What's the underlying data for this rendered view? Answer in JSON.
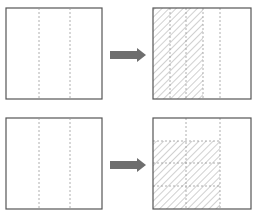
{
  "diagram": {
    "colors": {
      "outline": "#555555",
      "dashed": "#999999",
      "hatch": "#888888",
      "arrow": "#6e6e6e",
      "background": "#ffffff"
    },
    "rows": [
      {
        "name": "row-1",
        "left_square": {
          "x": 6,
          "y": 8,
          "w": 96,
          "h": 91,
          "vertical_dividers": [
            39,
            70
          ]
        },
        "arrow": {
          "x1": 110,
          "x2": 146,
          "y": 55
        },
        "right_square": {
          "x": 153,
          "y": 8,
          "w": 98,
          "h": 91,
          "vertical_dividers": [
            170,
            186,
            203,
            220
          ],
          "horizontal_dividers": [],
          "shaded": {
            "x": 153,
            "y": 8,
            "w": 50,
            "h": 91
          }
        }
      },
      {
        "name": "row-2",
        "left_square": {
          "x": 6,
          "y": 118,
          "w": 96,
          "h": 91,
          "vertical_dividers": [
            39,
            70
          ]
        },
        "arrow": {
          "x1": 110,
          "x2": 146,
          "y": 165
        },
        "right_square": {
          "x": 153,
          "y": 118,
          "w": 98,
          "h": 91,
          "vertical_dividers": [
            186,
            220
          ],
          "horizontal_dividers": [
            141,
            163,
            186
          ],
          "shaded": {
            "x": 153,
            "y": 141,
            "w": 67,
            "h": 68
          }
        }
      }
    ]
  }
}
